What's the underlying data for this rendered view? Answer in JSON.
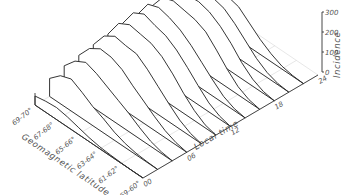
{
  "chart_data": {
    "type": "area",
    "subtype": "3d-waterfall",
    "title": "",
    "xlabel": "Local time",
    "ylabel": "Geomagnetic latitude",
    "zlabel": "Incidence",
    "x_ticks": [
      "00",
      "06",
      "12",
      "18",
      "24"
    ],
    "y_ticks": [
      "69-70°",
      "67-68°",
      "65-66°",
      "63-64°",
      "61-62°",
      "59-60°"
    ],
    "z_ticks": [
      "0",
      "100",
      "200",
      "300"
    ],
    "zlim": [
      0,
      300
    ],
    "grid": true,
    "latitude_bins": [
      "69-70°",
      "68-69°",
      "67-68°",
      "66-67°",
      "65-66°",
      "64-65°",
      "63-64°",
      "62-63°",
      "61-62°",
      "60-61°",
      "59-60°"
    ],
    "series": [
      {
        "name": "00h",
        "values": [
          45,
          55,
          60,
          50,
          35,
          20,
          10,
          5,
          2,
          0,
          0
        ]
      },
      {
        "name": "02h",
        "values": [
          90,
          140,
          160,
          130,
          95,
          70,
          40,
          20,
          8,
          3,
          0
        ]
      },
      {
        "name": "04h",
        "values": [
          110,
          170,
          200,
          180,
          150,
          120,
          90,
          55,
          25,
          8,
          0
        ]
      },
      {
        "name": "06h",
        "values": [
          120,
          190,
          225,
          220,
          195,
          150,
          110,
          70,
          35,
          12,
          0
        ]
      },
      {
        "name": "08h",
        "values": [
          130,
          210,
          245,
          235,
          230,
          190,
          140,
          90,
          45,
          15,
          0
        ]
      },
      {
        "name": "10h",
        "values": [
          140,
          230,
          260,
          250,
          240,
          210,
          160,
          100,
          50,
          15,
          0
        ]
      },
      {
        "name": "12h",
        "values": [
          150,
          240,
          270,
          250,
          235,
          200,
          150,
          95,
          45,
          15,
          0
        ]
      },
      {
        "name": "14h",
        "values": [
          150,
          240,
          260,
          245,
          220,
          180,
          130,
          80,
          35,
          10,
          0
        ]
      },
      {
        "name": "16h",
        "values": [
          150,
          230,
          250,
          240,
          230,
          205,
          150,
          90,
          40,
          12,
          0
        ]
      },
      {
        "name": "18h",
        "values": [
          140,
          210,
          235,
          240,
          225,
          190,
          140,
          80,
          35,
          10,
          0
        ]
      },
      {
        "name": "20h",
        "values": [
          120,
          180,
          210,
          215,
          200,
          160,
          110,
          60,
          25,
          6,
          0
        ]
      },
      {
        "name": "22h",
        "values": [
          90,
          140,
          170,
          180,
          165,
          120,
          75,
          40,
          15,
          4,
          0
        ]
      }
    ]
  },
  "axes": {
    "time_title": "Local time",
    "lat_title": "Geomagnetic latitude",
    "z_title": "Incidence",
    "time_ticks": [
      "00",
      "06",
      "12",
      "18",
      "24"
    ],
    "lat_ticks": [
      "69-70°",
      "67-68°",
      "65-66°",
      "63-64°",
      "61-62°",
      "59-60°"
    ],
    "z_ticks": [
      "0",
      "100",
      "200",
      "300"
    ]
  }
}
